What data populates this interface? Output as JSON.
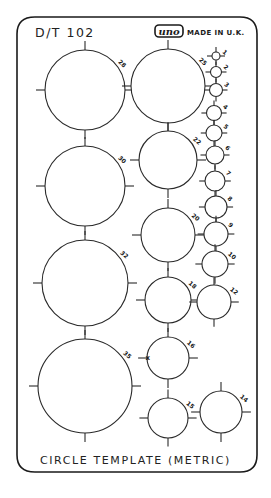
{
  "template": {
    "model": "D/T 102",
    "brand_logo": "uno",
    "made_in": "MADE IN U.K.",
    "footer_title": "CIRCLE TEMPLATE (METRIC)",
    "unit": "mm",
    "colors": {
      "ink": "#1a1a1a",
      "background": "#ffffff"
    }
  },
  "columns": [
    {
      "name": "left",
      "circles": [
        {
          "size": "28"
        },
        {
          "size": "30"
        },
        {
          "size": "32"
        },
        {
          "size": "35"
        }
      ]
    },
    {
      "name": "middle",
      "circles": [
        {
          "size": "25"
        },
        {
          "size": "22"
        },
        {
          "size": "20"
        },
        {
          "size": "18"
        },
        {
          "size": "16"
        },
        {
          "size": "15"
        }
      ]
    },
    {
      "name": "right",
      "circles": [
        {
          "size": "1"
        },
        {
          "size": "2"
        },
        {
          "size": "3"
        },
        {
          "size": "4"
        },
        {
          "size": "5"
        },
        {
          "size": "6"
        },
        {
          "size": "7"
        },
        {
          "size": "8"
        },
        {
          "size": "9"
        },
        {
          "size": "10"
        },
        {
          "size": "12"
        },
        {
          "size": "14"
        }
      ]
    }
  ],
  "marks": {
    "center_mark": "x"
  }
}
